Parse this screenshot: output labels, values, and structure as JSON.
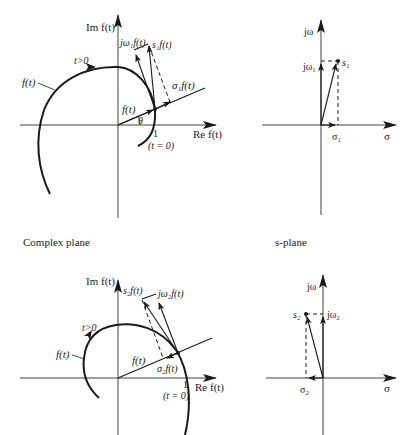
{
  "captions": {
    "complex_plane": "Complex plane",
    "s_plane": "s-plane"
  },
  "top_left": {
    "im_axis": "Im f(t)",
    "re_axis": "Re f(t)",
    "curve_label": "f(t)",
    "time_label": "t>0",
    "vector_label": "f(t)",
    "angle_label": "θ",
    "one_label": "1",
    "t0_label": "(t = 0)",
    "sigma_label": "σ₁f(t)",
    "jomega_label": "jω₁f(t)",
    "s_label": "s₁f(t)"
  },
  "top_right": {
    "y_axis": "jω",
    "x_axis": "σ",
    "point": "s₁",
    "jomega_tick": "jω₁",
    "sigma_tick": "σ₁"
  },
  "bottom_left": {
    "im_axis": "Im f(t)",
    "re_axis": "Re f(t)",
    "curve_label": "f(t)",
    "time_label": "t>0",
    "vector_label": "f(t)",
    "one_label": "1",
    "t0_label": "(t = 0)",
    "sigma_label": "σ₂f(t)",
    "jomega_label": "jω₂f(t)",
    "s_label": "s₂f(t)"
  },
  "bottom_right": {
    "y_axis": "jω",
    "x_axis": "σ",
    "point": "s₂",
    "jomega_tick": "jω₂",
    "sigma_tick": "σ₂"
  }
}
